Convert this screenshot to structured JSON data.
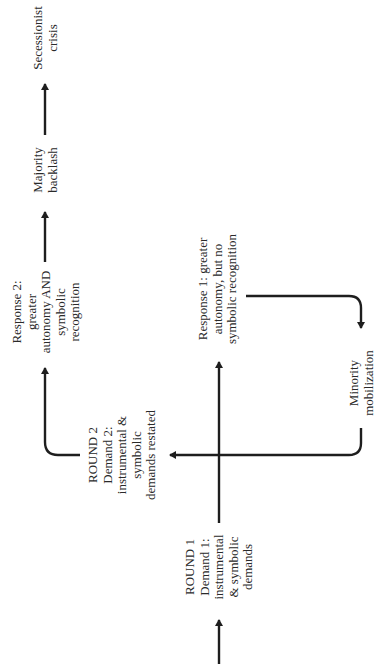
{
  "diagram": {
    "orientation": "rotated -90deg (reads bottom-to-top)",
    "colors": {
      "ink": "#1e1e1e",
      "background": "#ffffff"
    },
    "nodes": {
      "round1": {
        "lines": [
          "ROUND 1",
          "Demand 1:",
          "instrumental",
          "& symbolic",
          "demands"
        ]
      },
      "response1": {
        "lines": [
          "Response 1: greater",
          "autonomy, but no",
          "symbolic recognition"
        ]
      },
      "minority": {
        "lines": [
          "Minority",
          "mobilization"
        ]
      },
      "round2": {
        "lines": [
          "ROUND 2",
          "Demand 2:",
          "instrumental &",
          "symbolic",
          "demands restated"
        ]
      },
      "response2": {
        "lines": [
          "Response 2:",
          "greater",
          "autonomy AND",
          "symbolic",
          "recognition"
        ]
      },
      "backlash": {
        "lines": [
          "Majority",
          "backlash"
        ]
      },
      "secession": {
        "lines": [
          "Secessionist",
          "crisis"
        ]
      }
    },
    "edges": [
      {
        "from": "start",
        "to": "round1"
      },
      {
        "from": "round1",
        "to": "response1"
      },
      {
        "from": "response1",
        "to": "minority"
      },
      {
        "from": "minority",
        "to": "round2"
      },
      {
        "from": "round2",
        "to": "response2"
      },
      {
        "from": "response2",
        "to": "backlash"
      },
      {
        "from": "backlash",
        "to": "secession"
      }
    ]
  }
}
